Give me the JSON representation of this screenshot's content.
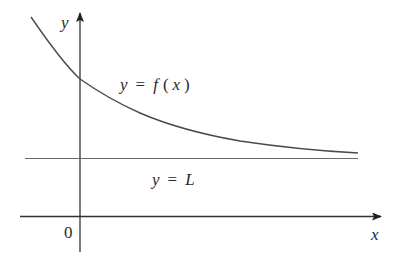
{
  "diagram": {
    "type": "function-graph",
    "axes": {
      "x_label": "x",
      "y_label": "y",
      "origin_label": "0"
    },
    "curve": {
      "label": "y = f(x)",
      "label_parts": {
        "lhs": "y",
        "eq": "=",
        "fn": "f",
        "open": "(",
        "arg": "x",
        "close": ")"
      },
      "behavior": "decreasing, concave up, approaches L as x increases"
    },
    "asymptote": {
      "label": "y = L",
      "label_parts": {
        "lhs": "y",
        "eq": "=",
        "rhs": "L"
      },
      "kind": "horizontal"
    },
    "colors": {
      "curve": "#4a4a4a",
      "axes": "#333333",
      "asymptote": "#6a6a6a",
      "text": "#2a2a2a",
      "background": "#ffffff"
    }
  }
}
